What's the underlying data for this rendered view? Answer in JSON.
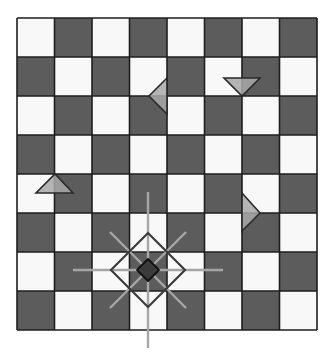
{
  "board": {
    "rows": 8,
    "cols": 8,
    "origin_x": 17,
    "origin_y": 18,
    "cell_w": 37.5,
    "cell_h": 39,
    "top_left_color": "light",
    "colors": {
      "light": "#f8f8f8",
      "dark": "#5c5c5c",
      "grid": "#1e1e1e",
      "background": "#ffffff"
    }
  },
  "pieces": [
    {
      "type": "triangle",
      "direction": "left",
      "name": "triangle-left-piece",
      "points": "167,78 149,96 167,114"
    },
    {
      "type": "triangle",
      "direction": "down",
      "name": "triangle-down-piece",
      "points": "224,78 260,78 242,96"
    },
    {
      "type": "triangle",
      "direction": "up",
      "name": "triangle-up-piece",
      "points": "36,193 73,193 55,174"
    },
    {
      "type": "triangle",
      "direction": "right",
      "name": "triangle-right-piece",
      "points": "242,193 260,213 242,231"
    }
  ],
  "piece_colors": {
    "triangle_fill": "#a8a8a8",
    "triangle_stroke": "#2a2a2a",
    "selected_fill": "#3a3a3a",
    "selected_stroke": "#111111",
    "move_lines": "#a6a6a6",
    "move_outline": "#3c3c3c"
  },
  "selected_piece": {
    "name": "selected-diamond-piece",
    "cx": 148,
    "cy": 270,
    "half": 11,
    "move_lines": [
      {
        "x1": 148,
        "y1": 192,
        "x2": 148,
        "y2": 348
      },
      {
        "x1": 73,
        "y1": 270,
        "x2": 223,
        "y2": 270
      },
      {
        "x1": 110,
        "y1": 232,
        "x2": 186,
        "y2": 308
      },
      {
        "x1": 186,
        "y1": 232,
        "x2": 110,
        "y2": 308
      }
    ],
    "move_outline_points": "148,233 185,270 148,307 111,270"
  }
}
